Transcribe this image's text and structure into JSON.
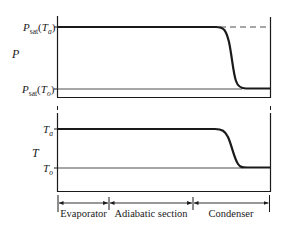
{
  "diagram": {
    "type": "heat-pipe-profile",
    "colors": {
      "ink": "#1a1a1a",
      "thin": "#3a3a3a",
      "background": "#ffffff"
    },
    "pressure_plot": {
      "axis_label": "P",
      "upper_level": {
        "base": "P",
        "sub": "sat",
        "arg": "T",
        "arg_sub": "a"
      },
      "lower_level": {
        "base": "P",
        "sub": "sat",
        "arg": "T",
        "arg_sub": "o"
      },
      "dashed_extension": true
    },
    "temperature_plot": {
      "axis_label": "T",
      "upper_level": {
        "base": "T",
        "sub": "a"
      },
      "lower_level": {
        "base": "T",
        "sub": "o"
      }
    },
    "sections": [
      {
        "label": "Evaporator"
      },
      {
        "label": "Adiabatic section"
      },
      {
        "label": "Condenser"
      }
    ]
  }
}
